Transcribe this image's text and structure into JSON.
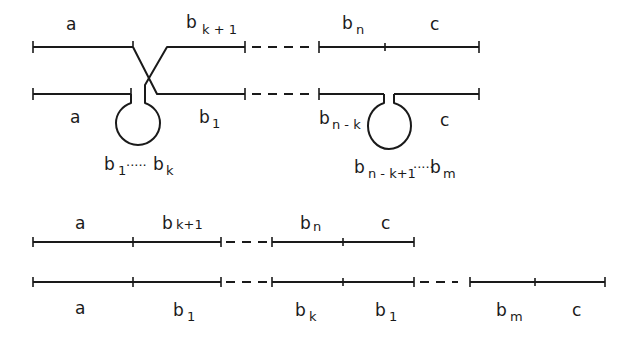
{
  "diagram": {
    "top": {
      "upper_row_labels": {
        "a": "a",
        "bk1_base": "b",
        "bk1_sub": "k + 1",
        "bn_base": "b",
        "bn_sub": "n",
        "c": "c"
      },
      "lower_row_labels": {
        "a": "a",
        "b1_base": "b",
        "b1_sub": "1",
        "bnk_base": "b",
        "bnk_sub": "n - k",
        "c": "c"
      },
      "loop_left": {
        "start_base": "b",
        "start_sub": "1",
        "dots": "·····",
        "end_base": "b",
        "end_sub": "k"
      },
      "loop_right": {
        "start_base": "b",
        "start_sub": "n - k+1",
        "dots": "·····",
        "end_base": "b",
        "end_sub": "m"
      }
    },
    "bottom": {
      "row1_labels": {
        "a": "a",
        "bk1_base": "b",
        "bk1_sub": "k+1",
        "bn_base": "b",
        "bn_sub": "n",
        "c": "c"
      },
      "row2_labels": {
        "a": "a",
        "b1_base": "b",
        "b1_sub": "1",
        "bk_base": "b",
        "bk_sub": "k",
        "b1b_base": "b",
        "b1b_sub": "1",
        "bm_base": "b",
        "bm_sub": "m",
        "c": "c"
      }
    }
  }
}
